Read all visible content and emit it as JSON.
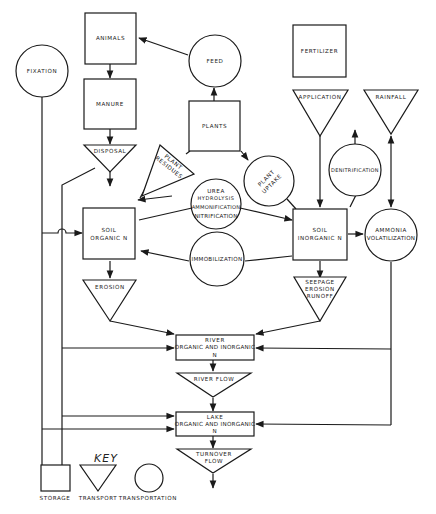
{
  "diagram": {
    "nodes": {
      "fixation": "FIXATION",
      "animals": "ANIMALS",
      "feed": "FEED",
      "manure": "MANURE",
      "plants": "PLANTS",
      "fertilizer": "FERTILIZER",
      "application": "APPLICATION",
      "rainfall": "RAINFALL",
      "disposal": "DISPOSAL",
      "plant_residues_1": "PLANT",
      "plant_residues_2": "RESIDUES",
      "plant_uptake_1": "PLANT",
      "plant_uptake_2": "UPTAKE",
      "denitrification": "DENITRIFICATION",
      "soil_organic_1": "SOIL",
      "soil_organic_2": "ORGANIC N",
      "urea_1": "UREA",
      "urea_2": "HYDROLYSIS",
      "urea_3": "AMMONIFICATION",
      "urea_4": "NITRIFICATION",
      "soil_inorganic_1": "SOIL",
      "soil_inorganic_2": "INORGANIC N",
      "ammonia_1": "AMMONIA",
      "ammonia_2": "VOLATILIZATION",
      "immobilization": "IMMOBILIZATION",
      "erosion": "EROSION",
      "seepage_1": "SEEPAGE",
      "seepage_2": "EROSION",
      "seepage_3": "RUNOFF",
      "river_1": "RIVER",
      "river_2": "ORGANIC AND INORGANIC",
      "river_3": "N",
      "river_flow": "RIVER FLOW",
      "lake_1": "LAKE",
      "lake_2": "ORGANIC AND INORGANIC",
      "lake_3": "N",
      "turnover_1": "TURNOVER",
      "turnover_2": "FLOW"
    },
    "key": {
      "title": "KEY",
      "storage": "STORAGE",
      "transport": "TRANSPORT",
      "transportation": "TRANSPORTATION"
    },
    "colors": {
      "stroke": "#1a1a1a",
      "background": "#ffffff"
    }
  }
}
